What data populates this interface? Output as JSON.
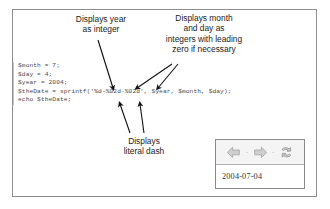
{
  "figure": {
    "frame_border_color": "#8e8e8e",
    "background_color": "#ffffff"
  },
  "code": {
    "language": "php",
    "text_color": "#4a4a4a",
    "lines": [
      "$month = 7;",
      "$day = 4;",
      "$year = 2004;",
      "$theDate = sprintf('%d-%02d-%02d', $year, $month, $day);",
      "echo $theDate;"
    ]
  },
  "annotations": [
    {
      "id": "year-callout",
      "text": "Displays year\nas integer",
      "target": "%d format specifier"
    },
    {
      "id": "monthday-callout",
      "text": "Displays month\nand day as\nintegers with leading\nzero if necessary",
      "target": "%02d format specifiers"
    },
    {
      "id": "dash-callout",
      "text": "Displays\nliteral dash",
      "target": "literal dash characters"
    }
  ],
  "browser": {
    "toolbar": {
      "back_label": "back-arrow",
      "forward_label": "forward-arrow",
      "refresh_label": "refresh",
      "separator": "·"
    },
    "output_text": "2004-07-04"
  }
}
